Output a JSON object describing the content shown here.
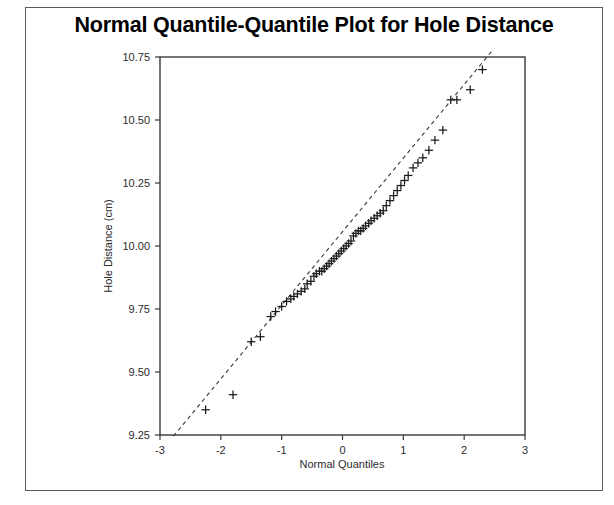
{
  "page": {
    "background": "#ffffff",
    "border_color": "#5a5a5a"
  },
  "title": "Normal Quantile-Quantile Plot for Hole Distance",
  "chart_data": {
    "type": "scatter",
    "title": "Normal Quantile-Quantile Plot for Hole Distance",
    "xlabel": "Normal Quantiles",
    "ylabel": "Hole Distance (cm)",
    "xlim": [
      -3,
      3
    ],
    "ylim": [
      9.25,
      10.75
    ],
    "xticks": [
      -3,
      -2,
      -1,
      0,
      1,
      2,
      3
    ],
    "xtick_labels": [
      "-3",
      "-2",
      "-1",
      "0",
      "1",
      "2",
      "3"
    ],
    "yticks": [
      9.25,
      9.5,
      9.75,
      10.0,
      10.25,
      10.5,
      10.75
    ],
    "ytick_labels": [
      "9.25",
      "9.50",
      "9.75",
      "10.00",
      "10.25",
      "10.50",
      "10.75"
    ],
    "grid": false,
    "legend": false,
    "marker": "plus",
    "marker_color": "#1a1a1a",
    "reference_line": {
      "style": "dashed",
      "color": "#3a3a3a",
      "x": [
        -2.78,
        2.46
      ],
      "y": [
        9.245,
        10.775
      ]
    },
    "series": [
      {
        "name": "Hole Distance",
        "points": [
          [
            -2.25,
            9.35
          ],
          [
            -1.8,
            9.41
          ],
          [
            -1.5,
            9.62
          ],
          [
            -1.35,
            9.64
          ],
          [
            -1.18,
            9.72
          ],
          [
            -1.1,
            9.74
          ],
          [
            -1.0,
            9.76
          ],
          [
            -0.92,
            9.78
          ],
          [
            -0.85,
            9.79
          ],
          [
            -0.8,
            9.8
          ],
          [
            -0.74,
            9.81
          ],
          [
            -0.68,
            9.82
          ],
          [
            -0.62,
            9.83
          ],
          [
            -0.58,
            9.85
          ],
          [
            -0.52,
            9.86
          ],
          [
            -0.47,
            9.88
          ],
          [
            -0.43,
            9.89
          ],
          [
            -0.38,
            9.9
          ],
          [
            -0.34,
            9.9
          ],
          [
            -0.3,
            9.91
          ],
          [
            -0.26,
            9.92
          ],
          [
            -0.22,
            9.93
          ],
          [
            -0.18,
            9.94
          ],
          [
            -0.14,
            9.95
          ],
          [
            -0.1,
            9.96
          ],
          [
            -0.06,
            9.97
          ],
          [
            -0.02,
            9.98
          ],
          [
            0.02,
            9.99
          ],
          [
            0.06,
            10.0
          ],
          [
            0.1,
            10.01
          ],
          [
            0.14,
            10.02
          ],
          [
            0.18,
            10.04
          ],
          [
            0.22,
            10.05
          ],
          [
            0.26,
            10.06
          ],
          [
            0.3,
            10.06
          ],
          [
            0.34,
            10.07
          ],
          [
            0.38,
            10.08
          ],
          [
            0.43,
            10.09
          ],
          [
            0.47,
            10.1
          ],
          [
            0.52,
            10.11
          ],
          [
            0.57,
            10.12
          ],
          [
            0.62,
            10.13
          ],
          [
            0.67,
            10.14
          ],
          [
            0.72,
            10.16
          ],
          [
            0.78,
            10.18
          ],
          [
            0.84,
            10.2
          ],
          [
            0.9,
            10.22
          ],
          [
            0.96,
            10.24
          ],
          [
            1.02,
            10.26
          ],
          [
            1.08,
            10.28
          ],
          [
            1.16,
            10.31
          ],
          [
            1.24,
            10.33
          ],
          [
            1.32,
            10.35
          ],
          [
            1.42,
            10.38
          ],
          [
            1.52,
            10.42
          ],
          [
            1.65,
            10.46
          ],
          [
            1.78,
            10.58
          ],
          [
            1.88,
            10.58
          ],
          [
            2.1,
            10.62
          ],
          [
            2.3,
            10.7
          ]
        ]
      }
    ]
  }
}
